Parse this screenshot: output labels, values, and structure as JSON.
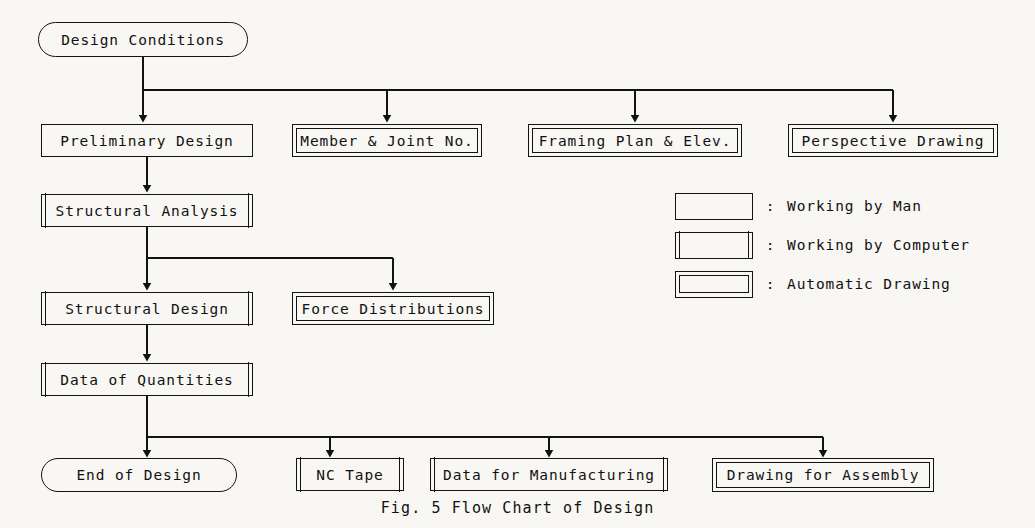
{
  "figure": {
    "caption": "Fig. 5   Flow Chart of Design",
    "background_color": "#f8f7f3",
    "line_color": "#121212"
  },
  "nodes": {
    "design_conditions": {
      "label": "Design Conditions",
      "style": "terminator",
      "x": 38,
      "y": 22,
      "w": 210,
      "h": 35
    },
    "preliminary_design": {
      "label": "Preliminary Design",
      "style": "man",
      "x": 41,
      "y": 124,
      "w": 212,
      "h": 33
    },
    "member_joint_no": {
      "label": "Member & Joint No.",
      "style": "auto",
      "x": 292,
      "y": 124,
      "w": 190,
      "h": 33
    },
    "framing_plan_elev": {
      "label": "Framing Plan & Elev.",
      "style": "auto",
      "x": 528,
      "y": 124,
      "w": 214,
      "h": 33
    },
    "perspective_drawing": {
      "label": "Perspective Drawing",
      "style": "auto",
      "x": 788,
      "y": 124,
      "w": 210,
      "h": 33
    },
    "structural_analysis": {
      "label": "Structural Analysis",
      "style": "computer",
      "x": 41,
      "y": 194,
      "w": 212,
      "h": 33
    },
    "structural_design": {
      "label": "Structural Design",
      "style": "computer",
      "x": 41,
      "y": 292,
      "w": 212,
      "h": 33
    },
    "force_distributions": {
      "label": "Force Distributions",
      "style": "auto",
      "x": 292,
      "y": 292,
      "w": 202,
      "h": 33
    },
    "data_of_quantities": {
      "label": "Data of Quantities",
      "style": "computer",
      "x": 41,
      "y": 363,
      "w": 212,
      "h": 33
    },
    "end_of_design": {
      "label": "End of Design",
      "style": "terminator",
      "x": 41,
      "y": 458,
      "w": 196,
      "h": 34
    },
    "nc_tape": {
      "label": "NC Tape",
      "style": "computer",
      "x": 296,
      "y": 458,
      "w": 108,
      "h": 33
    },
    "data_for_manufacturing": {
      "label": "Data for Manufacturing",
      "style": "computer",
      "x": 430,
      "y": 458,
      "w": 238,
      "h": 33
    },
    "drawing_for_assembly": {
      "label": "Drawing for Assembly",
      "style": "auto",
      "x": 712,
      "y": 458,
      "w": 222,
      "h": 34
    }
  },
  "legend": {
    "items": [
      {
        "swatch_style": "man",
        "colon": ":",
        "text": "Working by Man",
        "y": 0
      },
      {
        "swatch_style": "computer",
        "colon": ":",
        "text": "Working by Computer",
        "y": 39
      },
      {
        "swatch_style": "auto",
        "colon": ":",
        "text": "Automatic Drawing",
        "y": 78
      }
    ]
  },
  "flow": {
    "edges": [
      {
        "from": "design_conditions",
        "to": "preliminary_design",
        "kind": "bus-top"
      },
      {
        "from": "design_conditions",
        "to": "member_joint_no",
        "kind": "bus-top"
      },
      {
        "from": "design_conditions",
        "to": "framing_plan_elev",
        "kind": "bus-top"
      },
      {
        "from": "design_conditions",
        "to": "perspective_drawing",
        "kind": "bus-top"
      },
      {
        "from": "preliminary_design",
        "to": "structural_analysis",
        "kind": "straight"
      },
      {
        "from": "structural_analysis",
        "to": "structural_design",
        "kind": "straight"
      },
      {
        "from": "structural_analysis",
        "to": "force_distributions",
        "kind": "branch-right"
      },
      {
        "from": "structural_design",
        "to": "data_of_quantities",
        "kind": "straight"
      },
      {
        "from": "data_of_quantities",
        "to": "end_of_design",
        "kind": "bus-bottom"
      },
      {
        "from": "data_of_quantities",
        "to": "nc_tape",
        "kind": "bus-bottom"
      },
      {
        "from": "data_of_quantities",
        "to": "data_for_manufacturing",
        "kind": "bus-bottom"
      },
      {
        "from": "data_of_quantities",
        "to": "drawing_for_assembly",
        "kind": "bus-bottom"
      }
    ]
  }
}
